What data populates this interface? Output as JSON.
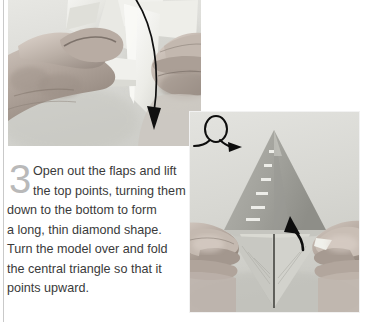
{
  "page": {
    "background_color": "#ffffff",
    "rule_color": "#c9c9c9"
  },
  "step": {
    "number": "3",
    "number_color": "#b9b9b9",
    "text_color": "#3a3a3a",
    "lines": [
      "Open out the flaps and lift",
      "the top points, turning them",
      "down to the bottom to form",
      "a long, thin diamond shape.",
      "Turn the model over and fold",
      "the central triangle so that it",
      "points upward."
    ],
    "full_text": "Open out the flaps and lift the top points, turning them down to the bottom to form a long, thin diamond shape. Turn the model over and fold the central triangle so that it points upward."
  },
  "photos": [
    {
      "id": "photo-top",
      "caption_alt": "Two hands opening out the flaps of a folded paper model",
      "annotations": [
        {
          "type": "curved-arrow-down",
          "color": "#111111"
        }
      ]
    },
    {
      "id": "photo-bottom",
      "caption_alt": "Two hands holding a long thin diamond paper model with a central triangle",
      "annotations": [
        {
          "type": "turn-over-symbol",
          "color": "#111111"
        },
        {
          "type": "arrow-up",
          "color": "#111111"
        }
      ]
    }
  ],
  "icons": {
    "turn_over": "turn-over-loop-arrow-icon",
    "fold_down": "curved-arrow-down-icon",
    "fold_up": "arrow-up-icon"
  }
}
